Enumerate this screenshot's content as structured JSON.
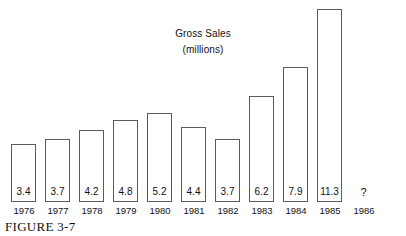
{
  "chart_data": {
    "type": "bar",
    "title": "Gross Sales",
    "subtitle": "(millions)",
    "xlabel": "",
    "ylabel": "",
    "ylim": [
      0,
      12
    ],
    "grid": false,
    "legend": null,
    "categories": [
      "1976",
      "1977",
      "1978",
      "1979",
      "1980",
      "1981",
      "1982",
      "1983",
      "1984",
      "1985",
      "1986"
    ],
    "values": [
      3.4,
      3.7,
      4.2,
      4.8,
      5.2,
      4.4,
      3.7,
      6.2,
      7.9,
      11.3,
      null
    ],
    "labels": [
      "3.4",
      "3.7",
      "4.2",
      "4.8",
      "5.2",
      "4.4",
      "3.7",
      "6.2",
      "7.9",
      "11.3",
      "?"
    ],
    "annotations": [
      "1986 value unknown, shown as ?"
    ]
  },
  "caption": {
    "text": "FIGURE 3-7"
  },
  "bars": [
    {
      "year": "1976",
      "label": "3.4",
      "value": 3.4
    },
    {
      "year": "1977",
      "label": "3.7",
      "value": 3.7
    },
    {
      "year": "1978",
      "label": "4.2",
      "value": 4.2
    },
    {
      "year": "1979",
      "label": "4.8",
      "value": 4.8
    },
    {
      "year": "1980",
      "label": "5.2",
      "value": 5.2
    },
    {
      "year": "1981",
      "label": "4.4",
      "value": 4.4
    },
    {
      "year": "1982",
      "label": "3.7",
      "value": 3.7
    },
    {
      "year": "1983",
      "label": "6.2",
      "value": 6.2
    },
    {
      "year": "1984",
      "label": "7.9",
      "value": 7.9
    },
    {
      "year": "1985",
      "label": "11.3",
      "value": 11.3
    },
    {
      "year": "1986",
      "label": "?",
      "value": null
    }
  ],
  "colors": {
    "bar_stroke": "#5b5b5b",
    "bar_fill": "#ffffff",
    "text": "#111111",
    "background": "#ffffff"
  }
}
